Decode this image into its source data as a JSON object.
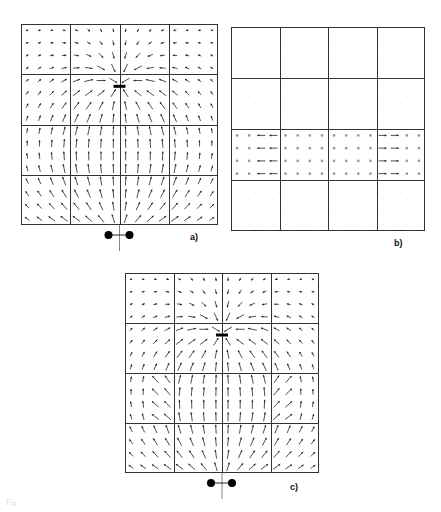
{
  "figure": {
    "caption_fragment": "Fig",
    "panels": [
      {
        "id": "a",
        "label": "a)",
        "box": {
          "x": 21,
          "y": 24,
          "w": 197,
          "h": 201
        },
        "grid": {
          "rows": 4,
          "cols": 4
        },
        "field": "sink_plus_source",
        "sink": {
          "fx": 0.5,
          "fy": 0.31
        },
        "source_dipole": {
          "y_offset": 10,
          "dots_dx": [
            -11,
            10
          ]
        },
        "label_pos": {
          "x": 190,
          "y": 232
        },
        "show_bar": true,
        "show_dipole": true
      },
      {
        "id": "b",
        "label": "b)",
        "box": {
          "x": 231,
          "y": 27,
          "w": 194,
          "h": 204
        },
        "grid": {
          "rows": 4,
          "cols": 4
        },
        "field": "horizontal_band",
        "band": {
          "row": 2
        },
        "label_pos": {
          "x": 394,
          "y": 238
        },
        "show_bar": false,
        "show_dipole": false
      },
      {
        "id": "c",
        "label": "c)",
        "box": {
          "x": 125,
          "y": 273,
          "w": 194,
          "h": 200
        },
        "grid": {
          "rows": 4,
          "cols": 4
        },
        "field": "combined",
        "sink": {
          "fx": 0.5,
          "fy": 0.31
        },
        "band": {
          "row": 2
        },
        "source_dipole": {
          "y_offset": 10,
          "dots_dx": [
            -11,
            10
          ]
        },
        "label_pos": {
          "x": 290,
          "y": 482
        },
        "show_bar": true,
        "show_dipole": true
      }
    ],
    "style": {
      "line_color": "#333333",
      "arrow_color": "#222222",
      "faint_color": "#9a9a9a",
      "samples_per_cell": 4
    }
  }
}
